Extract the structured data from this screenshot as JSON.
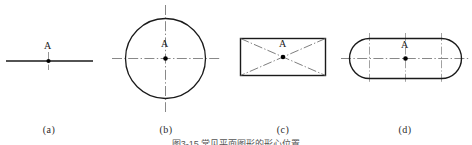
{
  "figure": {
    "caption": "图3-15  常见平面图形的形心位置",
    "point_label": "A",
    "subfigures": [
      {
        "key": "a",
        "label": "(a)",
        "shape": "line-segment",
        "description": "straight line with centroid point A at midpoint"
      },
      {
        "key": "b",
        "label": "(b)",
        "shape": "circle",
        "description": "circle with horizontal and vertical center lines intersecting at centroid A"
      },
      {
        "key": "c",
        "label": "(c)",
        "shape": "rectangle",
        "description": "rectangle with dash-dot diagonals intersecting at centroid A"
      },
      {
        "key": "d",
        "label": "(d)",
        "shape": "obround",
        "description": "stadium / obround shape with horizontal center line and three vertical center lines, centroid A at middle"
      }
    ],
    "colors": {
      "outline": "#1a1a1a",
      "centerline": "#6f6f6f",
      "point": "#000000",
      "label_text": "#2b2b2b",
      "caption_text": "#555555",
      "background": "#ffffff"
    }
  }
}
